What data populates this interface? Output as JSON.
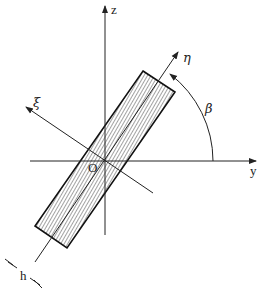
{
  "diagram": {
    "axes": {
      "z": {
        "label": "z"
      },
      "y": {
        "label": "y"
      },
      "eta": {
        "label": "η"
      },
      "zeta": {
        "label": "ξ"
      }
    },
    "origin": {
      "label": "O"
    },
    "angle": {
      "label": "β"
    },
    "thickness": {
      "label": "h"
    }
  }
}
